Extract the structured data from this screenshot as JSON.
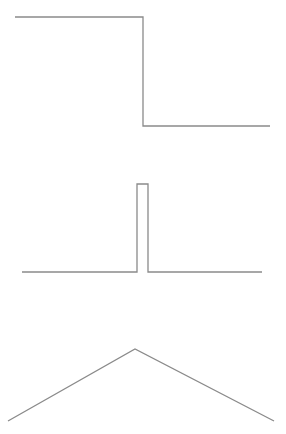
{
  "figure": {
    "width": 286,
    "height": 434,
    "background": "#ffffff",
    "stroke_color": "#8a8a8a",
    "stroke_width": 1.3
  },
  "waveforms": [
    {
      "name": "step-down",
      "description": "Step function (high to low)",
      "points": [
        [
          15,
          17
        ],
        [
          143,
          17
        ],
        [
          143,
          126
        ],
        [
          270,
          126
        ]
      ]
    },
    {
      "name": "rectangular-pulse",
      "description": "Narrow rectangular pulse (impulse-like)",
      "points": [
        [
          22,
          272
        ],
        [
          137,
          272
        ],
        [
          137,
          184
        ],
        [
          148,
          184
        ],
        [
          148,
          272
        ],
        [
          262,
          272
        ]
      ]
    },
    {
      "name": "triangle",
      "description": "Triangular (tent) function",
      "points": [
        [
          8,
          421
        ],
        [
          135,
          349
        ],
        [
          274,
          421
        ]
      ]
    }
  ]
}
